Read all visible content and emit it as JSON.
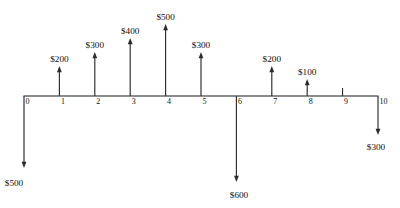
{
  "figure": {
    "type": "cash-flow-diagram",
    "background_color": "#ffffff",
    "line_color": "#1a1a1a",
    "arrow_color": "#2b2b2b",
    "text_color": "#0d0d0d",
    "currency_symbol": "$"
  },
  "axis": {
    "name": "time-axis",
    "tick_labels": [
      "0",
      "1",
      "2",
      "3",
      "4",
      "5",
      "6",
      "7",
      "8",
      "9",
      "10"
    ],
    "start_period": 0,
    "end_period": 10,
    "x_start_px": 24,
    "x_end_px": 378,
    "baseline_y_px": 96,
    "spacing_px": 35.4
  },
  "chart_data": {
    "type": "bar",
    "title": "",
    "xlabel": "",
    "ylabel": "",
    "categories": [
      "0",
      "1",
      "2",
      "3",
      "4",
      "5",
      "6",
      "7",
      "8",
      "9",
      "10"
    ],
    "values": [
      -500,
      200,
      300,
      400,
      500,
      300,
      -600,
      200,
      100,
      0,
      -300
    ],
    "ylim": [
      -600,
      500
    ],
    "grid": false,
    "legend": null
  },
  "cash_flows": [
    {
      "period": 0,
      "label": "$500",
      "amount": -500,
      "direction": "down",
      "tick_x": 24,
      "tip_y": 168,
      "label_y": 186,
      "label_anchor": "start",
      "label_x": 14,
      "has_tick": false
    },
    {
      "period": 1,
      "label": "$200",
      "amount": 200,
      "direction": "up",
      "tick_x": 59.4,
      "tip_y": 66,
      "label_y": 62,
      "label_anchor": "middle",
      "label_x": 59.4,
      "has_tick": true
    },
    {
      "period": 2,
      "label": "$300",
      "amount": 300,
      "direction": "up",
      "tick_x": 94.8,
      "tip_y": 52,
      "label_y": 48,
      "label_anchor": "middle",
      "label_x": 94.8,
      "has_tick": true
    },
    {
      "period": 3,
      "label": "$400",
      "amount": 400,
      "direction": "up",
      "tick_x": 130.2,
      "tip_y": 38,
      "label_y": 34,
      "label_anchor": "middle",
      "label_x": 130.2,
      "has_tick": true
    },
    {
      "period": 4,
      "label": "$500",
      "amount": 500,
      "direction": "up",
      "tick_x": 165.6,
      "tip_y": 24,
      "label_y": 20,
      "label_anchor": "middle",
      "label_x": 165.6,
      "has_tick": true
    },
    {
      "period": 5,
      "label": "$300",
      "amount": 300,
      "direction": "up",
      "tick_x": 201,
      "tip_y": 52,
      "label_y": 48,
      "label_anchor": "middle",
      "label_x": 201,
      "has_tick": true
    },
    {
      "period": 6,
      "label": "$600",
      "amount": -600,
      "direction": "down",
      "tick_x": 236.4,
      "tip_y": 182,
      "label_y": 198,
      "label_anchor": "middle",
      "label_x": 239,
      "has_tick": false
    },
    {
      "period": 7,
      "label": "$200",
      "amount": 200,
      "direction": "up",
      "tick_x": 271.8,
      "tip_y": 66,
      "label_y": 62,
      "label_anchor": "middle",
      "label_x": 271.8,
      "has_tick": true
    },
    {
      "period": 8,
      "label": "$100",
      "amount": 100,
      "direction": "up",
      "tick_x": 307.2,
      "tip_y": 79,
      "label_y": 75,
      "label_anchor": "middle",
      "label_x": 307.2,
      "has_tick": true
    },
    {
      "period": 9,
      "label": "",
      "amount": 0,
      "direction": "none",
      "tick_x": 342.6,
      "tip_y": 88,
      "label_y": 0,
      "label_anchor": "middle",
      "label_x": 342.6,
      "has_tick": true
    },
    {
      "period": 10,
      "label": "$300",
      "amount": -300,
      "direction": "down",
      "tick_x": 378,
      "tip_y": 135,
      "label_y": 150,
      "label_anchor": "middle",
      "label_x": 376,
      "has_tick": false
    }
  ]
}
